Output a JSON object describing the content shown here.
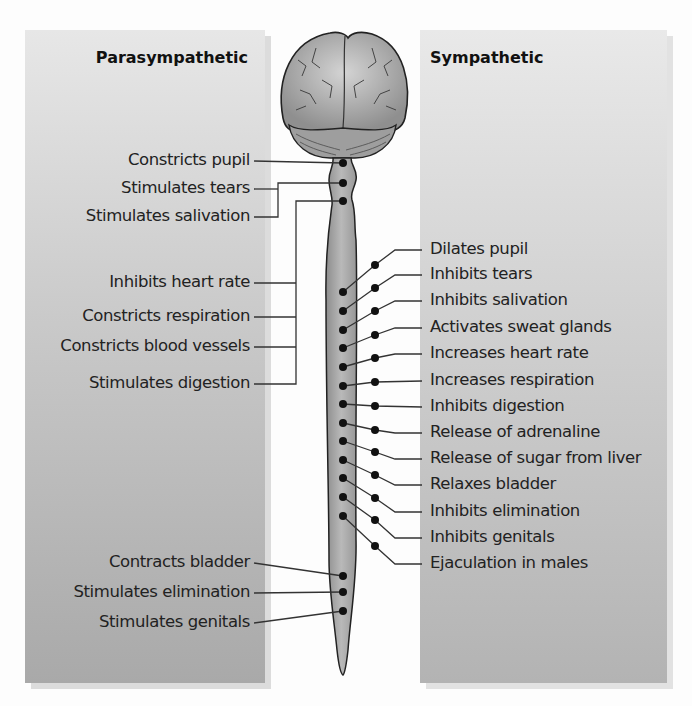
{
  "parasympathetic": {
    "heading": "Parasympathetic",
    "effects": [
      {
        "label": "Constricts pupil",
        "y": 161
      },
      {
        "label": "Stimulates tears",
        "y": 189
      },
      {
        "label": "Stimulates salivation",
        "y": 217
      },
      {
        "label": "Inhibits heart rate",
        "y": 283
      },
      {
        "label": "Constricts respiration",
        "y": 317
      },
      {
        "label": "Constricts blood vessels",
        "y": 347
      },
      {
        "label": "Stimulates digestion",
        "y": 384
      },
      {
        "label": "Contracts bladder",
        "y": 563
      },
      {
        "label": "Stimulates elimination",
        "y": 593
      },
      {
        "label": "Stimulates genitals",
        "y": 623
      }
    ]
  },
  "sympathetic": {
    "heading": "Sympathetic",
    "effects": [
      {
        "label": "Dilates pupil",
        "y": 250
      },
      {
        "label": "Inhibits tears",
        "y": 275
      },
      {
        "label": "Inhibits salivation",
        "y": 301
      },
      {
        "label": "Activates sweat glands",
        "y": 328
      },
      {
        "label": "Increases heart rate",
        "y": 354
      },
      {
        "label": "Increases respiration",
        "y": 381
      },
      {
        "label": "Inhibits digestion",
        "y": 407
      },
      {
        "label": "Release of adrenaline",
        "y": 433
      },
      {
        "label": "Release of sugar from liver",
        "y": 459
      },
      {
        "label": "Relaxes bladder",
        "y": 485
      },
      {
        "label": "Inhibits elimination",
        "y": 512
      },
      {
        "label": "Inhibits genitals",
        "y": 538
      },
      {
        "label": "Ejaculation in males",
        "y": 564
      }
    ]
  },
  "colors": {
    "panel_light": "#e7e7e7",
    "panel_dark": "#a9a9a9",
    "text": "#222222",
    "line": "#333333",
    "cord_fill": "#a8a8a8",
    "brain_fill": "#b5b5b5"
  }
}
